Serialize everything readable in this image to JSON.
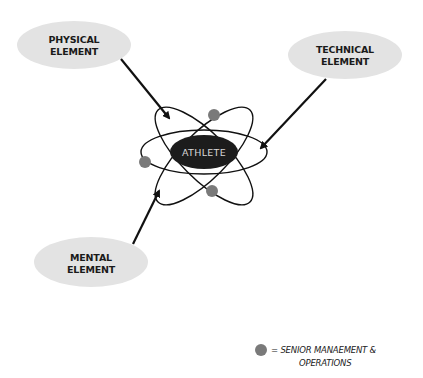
{
  "diagram": {
    "center": {
      "label": "ATHLETE"
    },
    "elements": [
      {
        "id": "physical",
        "line1": "PHYSICAL",
        "line2": "ELEMENT"
      },
      {
        "id": "technical",
        "line1": "TECHNICAL",
        "line2": "ELEMENT"
      },
      {
        "id": "mental",
        "line1": "MENTAL",
        "line2": "ELEMENT"
      }
    ],
    "legend": {
      "symbol": "grey-circle",
      "line1": "= SENIOR MANAEMENT &",
      "line2": "OPERATIONS"
    },
    "colors": {
      "bubble_fill": "#e3e3e3",
      "athlete_fill": "#1c1c1c",
      "electron_fill": "#7a7a7a",
      "line": "#111111"
    }
  }
}
